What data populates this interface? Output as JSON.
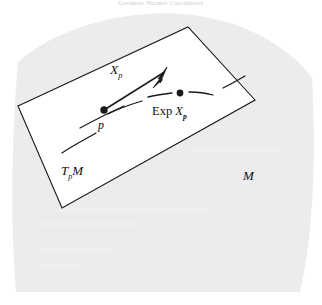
{
  "figure": {
    "header_caption": "Geodesic Normal Coordinates",
    "domain_kind": "differential-geometry-diagram",
    "colors": {
      "manifold_fill": "#ecebee",
      "tangent_plane_fill": "#ffffff",
      "stroke": "#1a1a1a",
      "caption": "#c9c9cf",
      "background": "#ffffff"
    },
    "labels": {
      "tangent_vector": "X",
      "tangent_vector_sub": "p",
      "base_point": "p",
      "exp_prefix": "Exp ",
      "exp_vector": "X",
      "exp_vector_sub": "p",
      "tangent_space": "T",
      "tangent_space_sub": "p",
      "tangent_space_tail": "M",
      "manifold": "M"
    },
    "geometry": {
      "manifold_outline": "M18,62 C60,24 140,6 200,16 C248,24 288,46 312,78 C316,150 314,232 300,292 L16,292 C10,220 12,130 18,62 Z",
      "tangent_plane_points": "18,106 188,27 255,100 62,208",
      "vector_line": {
        "x1": 104,
        "y1": 110,
        "x2": 166,
        "y2": 71
      },
      "arrowhead": "166,69 157,82 161,83 152,86",
      "base_point_dot": {
        "cx": 104,
        "cy": 110,
        "r": 3.6
      },
      "exp_point_dot": {
        "cx": 180,
        "cy": 93,
        "r": 3.4
      },
      "geodesic_dashes": [
        "M62,153 C72,146 84,140 96,133",
        "M80,128 C95,120 110,112 124,106",
        "M108,114 C120,108 132,104 142,101",
        "M148,97 C156,95 164,94 172,93",
        "M189,92 C198,92 206,93 213,95",
        "M223,88 C231,84 238,80 245,76"
      ]
    }
  }
}
